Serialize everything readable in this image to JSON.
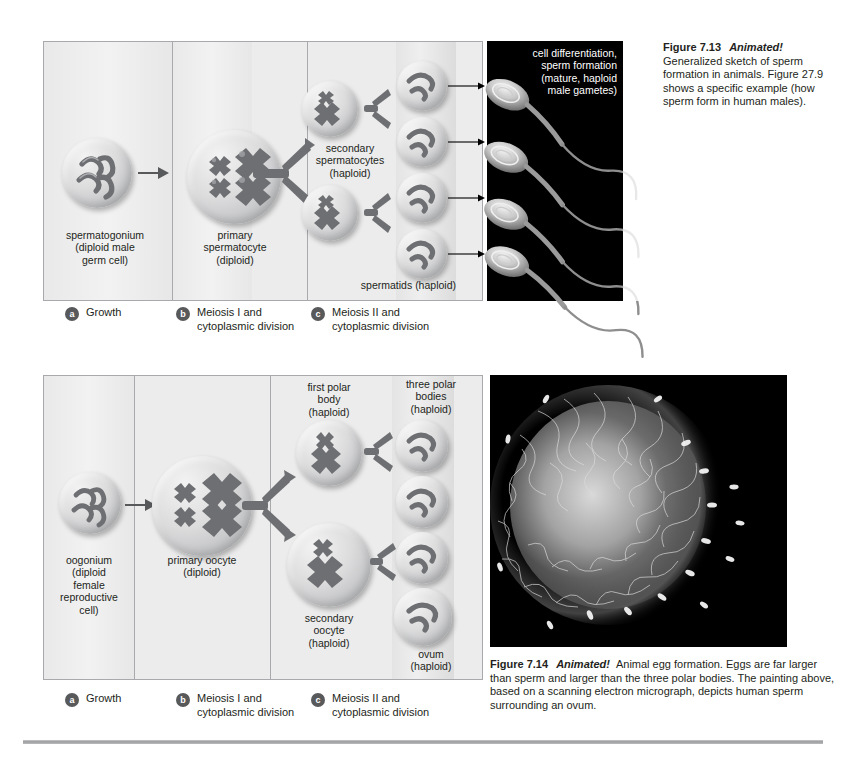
{
  "figure_713": {
    "caption_number": "Figure 7.13",
    "caption_animated": "Animated!",
    "caption_body": "Generalized sketch of sperm formation in animals. Figure 27.9 shows a specific example (how sperm form in human males).",
    "diagram_labels": {
      "spermatogonium": "spermatogonium\n(diploid male\ngerm cell)",
      "primary_spermatocyte": "primary\nspermatocyte\n(diploid)",
      "secondary_spermatocytes": "secondary\nspermatocytes\n(haploid)",
      "spermatids": "spermatids (haploid)"
    },
    "photo_label": "cell differentiation,\nsperm formation\n(mature, haploid\nmale gametes)",
    "steps": [
      {
        "letter": "a",
        "text": "Growth"
      },
      {
        "letter": "b",
        "text": "Meiosis I and\ncytoplasmic division"
      },
      {
        "letter": "c",
        "text": "Meiosis II and\ncytoplasmic division"
      }
    ]
  },
  "figure_714": {
    "caption_number": "Figure 7.14",
    "caption_animated": "Animated!",
    "caption_body": "Animal egg formation. Eggs are far larger than sperm and larger than the three polar bodies. The painting above, based on a scanning electron micrograph, depicts human sperm surrounding an ovum.",
    "diagram_labels": {
      "oogonium": "oogonium\n(diploid\nfemale\nreproductive\ncell)",
      "primary_oocyte": "primary oocyte\n(diploid)",
      "first_polar_body": "first polar\nbody\n(haploid)",
      "secondary_oocyte": "secondary\noocyte\n(haploid)",
      "three_polar_bodies": "three polar\nbodies\n(haploid)",
      "ovum": "ovum\n(haploid)"
    },
    "steps": [
      {
        "letter": "a",
        "text": "Growth"
      },
      {
        "letter": "b",
        "text": "Meiosis I and\ncytoplasmic division"
      },
      {
        "letter": "c",
        "text": "Meiosis II and\ncytoplasmic division"
      }
    ]
  },
  "colors": {
    "page_background": "#ffffff",
    "panel_background": "#ececed",
    "panel_border": "#a8a9ad",
    "photo_background": "#000000",
    "text": "#231f20",
    "badge": "#58595b",
    "chromosome": "#6e6f72"
  }
}
